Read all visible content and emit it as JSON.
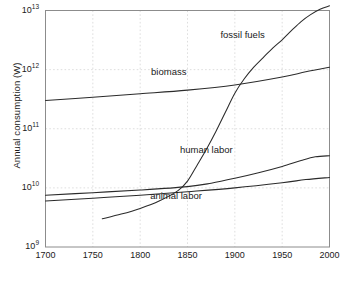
{
  "chart_data": {
    "type": "line",
    "title": "",
    "xlabel": "",
    "ylabel": "Annual consumption (W)",
    "xlim": [
      1700,
      2000
    ],
    "ylim": [
      1000000000,
      10000000000000
    ],
    "yscale": "log",
    "xscale": "linear",
    "grid": true,
    "legend_position": "inline-labels",
    "xticks": [
      "1700",
      "1750",
      "1800",
      "1850",
      "1900",
      "1950",
      "2000"
    ],
    "xtick_values": [
      1700,
      1750,
      1800,
      1850,
      1900,
      1950,
      2000
    ],
    "yticks": [
      {
        "mantissa": "10",
        "exponent": "9",
        "value": 1000000000
      },
      {
        "mantissa": "10",
        "exponent": "10",
        "value": 10000000000
      },
      {
        "mantissa": "10",
        "exponent": "11",
        "value": 100000000000
      },
      {
        "mantissa": "10",
        "exponent": "12",
        "value": 1000000000000
      },
      {
        "mantissa": "10",
        "exponent": "13",
        "value": 10000000000000
      }
    ],
    "series": [
      {
        "name": "fossil fuels",
        "label": "fossil fuels",
        "label_x": 1908,
        "label_y": 3800000000000,
        "x": [
          1760,
          1780,
          1800,
          1820,
          1840,
          1850,
          1860,
          1870,
          1880,
          1890,
          1900,
          1910,
          1920,
          1930,
          1940,
          1950,
          1960,
          1970,
          1980,
          1990,
          2000
        ],
        "y": [
          3000000000,
          3600000000,
          4500000000,
          6000000000,
          9000000000,
          13000000000,
          24000000000,
          45000000000,
          90000000000,
          190000000000,
          400000000000,
          700000000000,
          1100000000000,
          1600000000000,
          2300000000000,
          3200000000000,
          4600000000000,
          6500000000000,
          8500000000000,
          10500000000000,
          12000000000000
        ]
      },
      {
        "name": "biomass",
        "label": "biomass",
        "label_x": 1830,
        "label_y": 900000000000,
        "x": [
          1700,
          1750,
          1800,
          1850,
          1900,
          1950,
          1975,
          2000
        ],
        "y": [
          300000000000,
          340000000000,
          390000000000,
          450000000000,
          550000000000,
          750000000000,
          920000000000,
          1100000000000
        ]
      },
      {
        "name": "human labor",
        "label": "human labor",
        "label_x": 1870,
        "label_y": 44000000000,
        "x": [
          1700,
          1750,
          1800,
          1850,
          1875,
          1900,
          1925,
          1950,
          1970,
          1985,
          2000
        ],
        "y": [
          7500000000,
          8300000000,
          9200000000,
          10500000000,
          12000000000,
          14500000000,
          18000000000,
          23000000000,
          29000000000,
          33500000000,
          35000000000
        ]
      },
      {
        "name": "animal labor",
        "label": "animal labor",
        "label_x": 1838,
        "label_y": 7300000000,
        "x": [
          1700,
          1750,
          1800,
          1850,
          1900,
          1950,
          1975,
          2000
        ],
        "y": [
          6000000000,
          6700000000,
          7500000000,
          8600000000,
          10000000000,
          12200000000,
          13800000000,
          15000000000
        ]
      }
    ]
  },
  "style": {
    "line_color": "#2b2b2b",
    "grid_color": "#d6d6d6",
    "frame_color": "#8c8c8c",
    "background": "#ffffff",
    "text_color": "#1a1a1a"
  }
}
